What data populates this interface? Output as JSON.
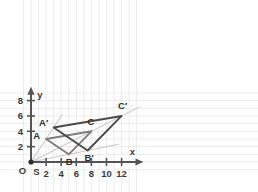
{
  "chart_data": {
    "type": "scatter",
    "title": "",
    "xlabel": "x",
    "ylabel": "y",
    "xlim": [
      -1.2,
      14.5
    ],
    "ylim": [
      -1.3,
      9.4
    ],
    "grid": true,
    "grid_step": 1,
    "legend": "none",
    "x_ticks": [
      2,
      4,
      6,
      8,
      10,
      12
    ],
    "y_ticks": [
      2,
      4,
      6,
      8
    ],
    "x_tick_labels": [
      "2",
      "4",
      "6",
      "8",
      "10",
      "12"
    ],
    "y_tick_labels": [
      "2",
      "4",
      "6",
      "8"
    ],
    "center": {
      "label": "S",
      "x": 0,
      "y": 0
    },
    "origin_label": "O",
    "scale_factor": 1.5,
    "series": [
      {
        "name": "Triangle ABC",
        "color": "#7d7d7d",
        "closed": true,
        "points": [
          {
            "label": "A",
            "x": 2,
            "y": 3
          },
          {
            "label": "B",
            "x": 5,
            "y": 1
          },
          {
            "label": "C",
            "x": 8,
            "y": 4
          }
        ]
      },
      {
        "name": "Triangle A'B'C'",
        "color": "#4a4a4a",
        "closed": true,
        "points": [
          {
            "label": "A′",
            "x": 3,
            "y": 4.5
          },
          {
            "label": "B′",
            "x": 7.5,
            "y": 1.5
          },
          {
            "label": "C′",
            "x": 12,
            "y": 6
          }
        ]
      }
    ],
    "rays": [
      {
        "name": "ray-S-A-Aprime",
        "from": [
          0,
          0
        ],
        "to": [
          4.1,
          6.15
        ],
        "color": "#c9c9c9"
      },
      {
        "name": "ray-S-B-Bprime",
        "from": [
          0,
          0
        ],
        "to": [
          11.6,
          2.32
        ],
        "color": "#c9c9c9"
      },
      {
        "name": "ray-S-C-Cprime",
        "from": [
          0,
          0
        ],
        "to": [
          14.3,
          7.15
        ],
        "color": "#c9c9c9"
      }
    ]
  },
  "labels": {
    "x_axis": "x",
    "y_axis": "y",
    "origin": "O",
    "center": "S",
    "A": "A",
    "B": "B",
    "C": "C",
    "A_prime": "A′",
    "B_prime": "B′",
    "C_prime": "C′",
    "tick_x_2": "2",
    "tick_x_4": "4",
    "tick_x_6": "6",
    "tick_x_8": "8",
    "tick_x_10": "10",
    "tick_x_12": "12",
    "tick_y_2": "2",
    "tick_y_4": "4",
    "tick_y_6": "6",
    "tick_y_8": "8"
  },
  "colors": {
    "background": "#ffffff",
    "grid": "#ececec",
    "axis": "#545454",
    "triangle_original": "#7d7d7d",
    "triangle_image": "#4a4a4a",
    "ray": "#c9c9c9",
    "text": "#2d2d2d"
  }
}
